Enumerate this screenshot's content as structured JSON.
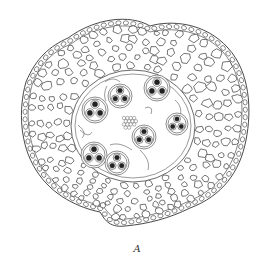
{
  "figure": {
    "caption": "A",
    "colors": {
      "line": "#333333",
      "background": "#ffffff",
      "fill_dark": "#222222"
    },
    "vascular_bundle_count": 7
  }
}
